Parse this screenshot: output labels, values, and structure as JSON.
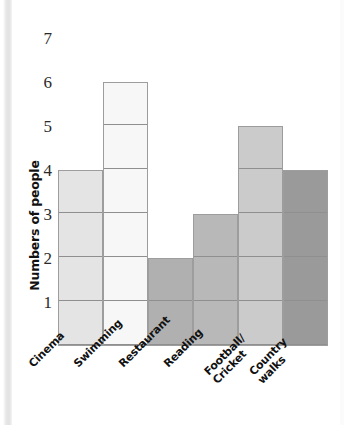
{
  "chart_data": {
    "type": "bar",
    "title": "",
    "xlabel": "",
    "ylabel": "Numbers of people",
    "categories": [
      "Cinema",
      "Swimming",
      "Restaurant",
      "Reading",
      "Football/\nCricket",
      "Country\nwalks"
    ],
    "values": [
      4,
      6,
      2,
      3,
      5,
      4
    ],
    "ylim": [
      0,
      7
    ],
    "yticks": [
      "1",
      "2",
      "3",
      "4",
      "5",
      "6",
      "7"
    ],
    "grid": false,
    "legend": "none",
    "bar_colors": [
      "#e4e4e4",
      "#f7f7f7",
      "#b0b0b0",
      "#b8b8b8",
      "#cbcbcb",
      "#9a9a9a"
    ],
    "gridline_color": "#8f8f8f",
    "bar_border_color": "#9d9d9d"
  },
  "axis": {
    "y_title": "Numbers of people",
    "ticks": [
      {
        "label": "7",
        "value": 7
      },
      {
        "label": "6",
        "value": 6
      },
      {
        "label": "5",
        "value": 5
      },
      {
        "label": "4",
        "value": 4
      },
      {
        "label": "3",
        "value": 3
      },
      {
        "label": "2",
        "value": 2
      },
      {
        "label": "1",
        "value": 1
      }
    ]
  },
  "bars": [
    {
      "label": "Cinema",
      "label_line1": "Cinema",
      "label_line2": "",
      "value": 4,
      "color": "#e4e4e4"
    },
    {
      "label": "Swimming",
      "label_line1": "Swimming",
      "label_line2": "",
      "value": 6,
      "color": "#f7f7f7"
    },
    {
      "label": "Restaurant",
      "label_line1": "Restaurant",
      "label_line2": "",
      "value": 2,
      "color": "#b0b0b0"
    },
    {
      "label": "Reading",
      "label_line1": "Reading",
      "label_line2": "",
      "value": 3,
      "color": "#b8b8b8"
    },
    {
      "label": "Football/Cricket",
      "label_line1": "Football/",
      "label_line2": "Cricket",
      "value": 5,
      "color": "#cbcbcb"
    },
    {
      "label": "Country walks",
      "label_line1": "Country",
      "label_line2": "walks",
      "value": 4,
      "color": "#9a9a9a"
    }
  ]
}
